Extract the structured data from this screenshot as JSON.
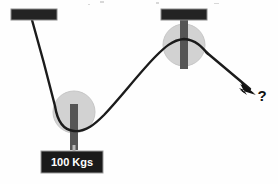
{
  "diagram": {
    "background_color": "#fefefe",
    "rope_color": "#1a1a1a",
    "anchor_color": "#222222",
    "pulley_fill": "#d2d2d2",
    "pulley_stroke": "#c0c0c0",
    "hanger_color": "#555555",
    "label_box_color": "#1a1a1a",
    "label_text_color": "#ffffff",
    "ceiling_anchors": [
      {
        "name": "left-ceiling-anchor",
        "x": 11,
        "y": 9,
        "width": 46,
        "height": 11
      },
      {
        "name": "right-ceiling-anchor",
        "x": 161,
        "y": 9,
        "width": 46,
        "height": 11
      }
    ],
    "pulleys": [
      {
        "name": "movable-pulley",
        "cx": 74,
        "cy": 112,
        "r": 21,
        "hanger": {
          "x": 70,
          "y": 104,
          "width": 8,
          "height": 44
        }
      },
      {
        "name": "fixed-pulley",
        "cx": 184,
        "cy": 44,
        "r": 21,
        "hanger": {
          "x": 180,
          "y": 16,
          "width": 8,
          "height": 52
        }
      }
    ],
    "weight": {
      "label": "100 Kgs",
      "box": {
        "x": 41,
        "y": 151,
        "width": 62,
        "height": 22
      }
    },
    "force_marker": {
      "label": "?",
      "label_x": 262,
      "label_y": 101,
      "arrow_tip": {
        "x": 253,
        "y": 92
      }
    },
    "rope": {
      "description": "Rope from left ceiling anchor down around movable pulley, up over fixed pulley, then down-right to applied force arrow",
      "segments": [
        {
          "name": "left-descending-segment",
          "from": "left-ceiling-anchor",
          "to": "movable-pulley-bottom"
        },
        {
          "name": "rising-segment",
          "from": "movable-pulley-bottom",
          "to": "fixed-pulley-top"
        },
        {
          "name": "pull-segment",
          "from": "fixed-pulley-right",
          "to": "force-arrow"
        }
      ]
    }
  }
}
